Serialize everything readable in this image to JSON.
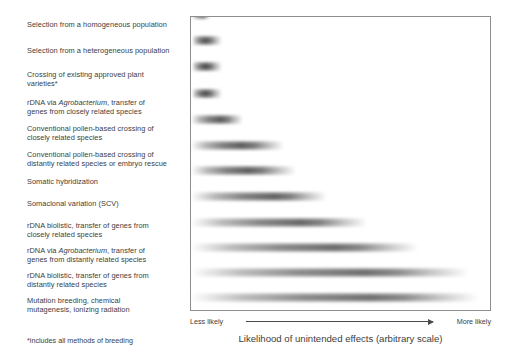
{
  "figure": {
    "title_caption": "Likelihood of unintended effects (arbitrary scale)",
    "footnote": "*includes all methods of breeding",
    "axis": {
      "left_label": "Less likely",
      "right_label": "More likely",
      "arrow_icon": "right-arrow-icon"
    }
  },
  "chart_data": {
    "type": "bar",
    "title": "Likelihood of unintended effects (arbitrary scale)",
    "xlabel": "Likelihood of unintended effects (arbitrary scale)",
    "ylabel": "",
    "grid": false,
    "legend": null,
    "axis_left_tick": "Less likely",
    "axis_right_tick": "More likely",
    "xlim": [
      0,
      100
    ],
    "note": "Horizontal fuzzy gradient bands; extent indicates relative likelihood of unintended effects on an arbitrary scale. 'value' = right extent of band as percent of plot width; 'start' = left extent; 'peak' = position of darkest core.",
    "categories": [
      "Selection from a homogeneous population",
      "Selection from a heterogeneous population",
      "Crossing of existing approved plant varieties*",
      "rDNA via Agrobacterium, transfer of genes from closely related species",
      "Conventional pollen-based crossing of closely related species",
      "Conventional pollen-based crossing of distantly related species or embryo rescue",
      "Somatic hybridization",
      "Somaclonal variation (SCV)",
      "rDNA biolistic, transfer of genes from closely related species",
      "rDNA via Agrobacterium, transfer of genes from distantly related species",
      "rDNA biolistic, transfer of genes from distantly related species",
      "Mutation breeding, chemical mutagenesis, ionizing radiation"
    ],
    "values": [
      6,
      10,
      10,
      10,
      17,
      31,
      35,
      45,
      59,
      76,
      93,
      96
    ],
    "series": [
      {
        "name": "Likelihood band",
        "values": [
          6,
          10,
          10,
          10,
          17,
          31,
          35,
          45,
          59,
          76,
          93,
          96
        ]
      }
    ]
  },
  "rows": [
    {
      "label_html": "Selection from a homogeneous population",
      "label": "Selection from a homogeneous population",
      "top": 20,
      "lines": 1,
      "bar": {
        "top": 8,
        "start": 0.5,
        "peak": 4,
        "end": 6.5,
        "core": "#5e5e5e"
      }
    },
    {
      "label_html": "Selection from a heterogeneous population",
      "label": "Selection from a heterogeneous population",
      "top": 46,
      "lines": 1,
      "bar": {
        "top": 34,
        "start": 0.5,
        "peak": 5,
        "end": 10.5,
        "core": "#545454"
      }
    },
    {
      "label_html": "Crossing of existing approved plant<br>varieties*",
      "label": "Crossing of existing approved plant varieties*",
      "top": 70,
      "lines": 2,
      "bar": {
        "top": 60,
        "start": 0.5,
        "peak": 5,
        "end": 10.5,
        "core": "#4d4d4d"
      }
    },
    {
      "label_html": "rDNA via <i>Agrobacterium</i>, transfer of<br>genes from closely related species",
      "label": "rDNA via Agrobacterium, transfer of genes from closely related species",
      "top": 98,
      "lines": 2,
      "bar": {
        "top": 87,
        "start": 0.5,
        "peak": 5,
        "end": 10.5,
        "core": "#4f4f4f"
      }
    },
    {
      "label_html": "Conventional pollen-based crossing of<br>closely related species",
      "label": "Conventional pollen-based crossing of closely related species",
      "top": 124,
      "lines": 2,
      "bar": {
        "top": 113,
        "start": 0.0,
        "peak": 10,
        "end": 17.5,
        "core": "#5a5a5a"
      }
    },
    {
      "label_html": "Conventional pollen-based crossing of<br>distantly related species or embryo rescue",
      "label": "Conventional pollen-based crossing of distantly related species or embryo rescue",
      "top": 150,
      "lines": 2,
      "bar": {
        "top": 139,
        "start": 0.0,
        "peak": 17,
        "end": 31,
        "core": "#5c5c5c"
      }
    },
    {
      "label_html": "Somatic hybridization",
      "label": "Somatic hybridization",
      "top": 177,
      "lines": 1,
      "bar": {
        "top": 164,
        "start": 0.0,
        "peak": 19,
        "end": 35,
        "core": "#5e5e5e"
      }
    },
    {
      "label_html": "Somaclonal variation (SCV)",
      "label": "Somaclonal variation (SCV)",
      "top": 199,
      "lines": 1,
      "bar": {
        "top": 190,
        "start": 0.0,
        "peak": 28,
        "end": 45.5,
        "core": "#616161"
      }
    },
    {
      "label_html": "rDNA biolistic, transfer of genes from<br>closely related species",
      "label": "rDNA biolistic, transfer of genes from closely related species",
      "top": 221,
      "lines": 2,
      "bar": {
        "top": 216,
        "start": 0.0,
        "peak": 37,
        "end": 59,
        "core": "#666666"
      }
    },
    {
      "label_html": "rDNA via <i>Agrobacterium</i>, transfer of<br>genes from distantly related species",
      "label": "rDNA via Agrobacterium, transfer of genes from distantly related species",
      "top": 246,
      "lines": 2,
      "bar": {
        "top": 241,
        "start": 0.0,
        "peak": 48,
        "end": 76,
        "core": "#6a6a6a"
      }
    },
    {
      "label_html": "rDNA biolistic, transfer of genes from<br>distantly related species",
      "label": "rDNA biolistic, transfer of genes from distantly related species",
      "top": 271,
      "lines": 2,
      "bar": {
        "top": 266,
        "start": 0.0,
        "peak": 58,
        "end": 93,
        "core": "#6d6d6d"
      }
    },
    {
      "label_html": "Mutation breeding, chemical<br>mutagenesis, ionizing radiation",
      "label": "Mutation breeding, chemical mutagenesis, ionizing radiation",
      "top": 296,
      "lines": 2,
      "bar": {
        "top": 291,
        "start": 0.0,
        "peak": 60,
        "end": 96,
        "core": "#6e6e6e"
      }
    }
  ]
}
